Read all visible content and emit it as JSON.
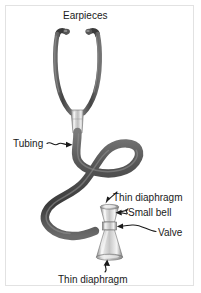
{
  "figure": {
    "background_color": "#ffffff",
    "frame_color": "#e2e2e2",
    "ink_color": "#1a1a1a",
    "tubing_color": "#4d4d4d",
    "metal_color": "#b3b3b3"
  },
  "labels": {
    "earpieces": "Earpieces",
    "tubing": "Tubing",
    "thin_diaphragm_top": "Thin diaphragm",
    "small_bell": "Small bell",
    "valve": "Valve",
    "thin_diaphragm_bottom": "Thin diaphragm"
  },
  "parts": {
    "earpiece_left": "earpiece-left",
    "earpiece_right": "earpiece-right",
    "binaural_left": "binaural-tube-left",
    "binaural_right": "binaural-tube-right",
    "y_junction": "y-junction-connector",
    "tubing": "flexible-tubing",
    "small_bell": "small-bell-cone",
    "valve": "valve-stem",
    "large_bell": "large-bell-cone",
    "diaphragm_top": "top-diaphragm-disc",
    "diaphragm_bottom": "bottom-diaphragm-disc"
  }
}
